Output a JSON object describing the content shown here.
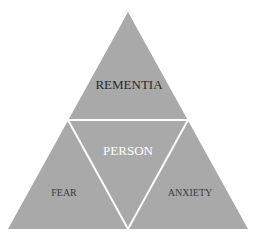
{
  "diagram": {
    "type": "triangle-pyramid",
    "colors": {
      "fill": "#a9a9a9",
      "divider": "#ffffff",
      "dark_text": "#2a2a2a",
      "light_text": "#ffffff"
    },
    "sections": {
      "top": {
        "label": "REMENTIA"
      },
      "center": {
        "label": "PERSON"
      },
      "bottom_left": {
        "label": "FEAR"
      },
      "bottom_right": {
        "label": "ANXIETY"
      }
    }
  }
}
